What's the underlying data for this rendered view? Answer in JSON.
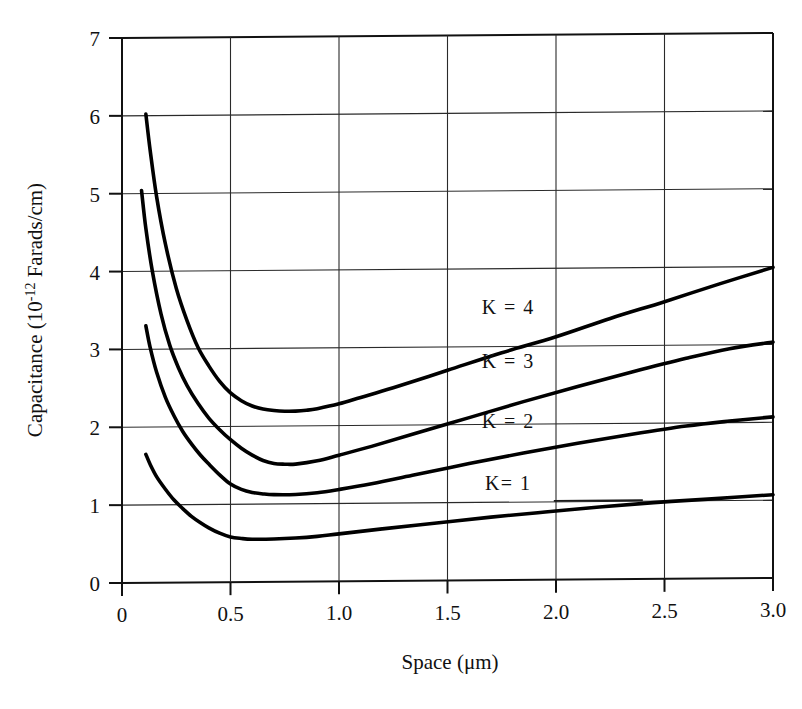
{
  "chart_data": {
    "type": "line",
    "title": "",
    "xlabel": "Space (μm)",
    "ylabel": "Capacitance (10-12 Farads/cm)",
    "ylabel_base": "Capacitance (10",
    "ylabel_exponent": "-12",
    "ylabel_tail": " Farads/cm)",
    "xlabel_text": "Space (μm)",
    "xlim": [
      0,
      3.0
    ],
    "ylim": [
      0,
      7
    ],
    "grid": true,
    "legend_position": "inline-annotations",
    "xticks": [
      "0",
      "0.5",
      "1.0",
      "1.5",
      "2.0",
      "2.5",
      "3.0"
    ],
    "xtick_values": [
      0,
      0.5,
      1.0,
      1.5,
      2.0,
      2.5,
      3.0
    ],
    "yticks": [
      "0",
      "1",
      "2",
      "3",
      "4",
      "5",
      "6",
      "7"
    ],
    "ytick_values": [
      0,
      1,
      2,
      3,
      4,
      5,
      6,
      7
    ],
    "series": [
      {
        "name": "K = 4",
        "label": "K = 4",
        "x": [
          0.11,
          0.13,
          0.16,
          0.2,
          0.25,
          0.3,
          0.35,
          0.4,
          0.45,
          0.5,
          0.55,
          0.6,
          0.65,
          0.7,
          0.75,
          0.8,
          0.85,
          0.9,
          1.0,
          1.1,
          1.25,
          1.5,
          1.75,
          2.0,
          2.25,
          2.5,
          2.75,
          3.0
        ],
        "values": [
          6.02,
          5.55,
          4.95,
          4.35,
          3.78,
          3.36,
          3.02,
          2.78,
          2.58,
          2.43,
          2.33,
          2.26,
          2.22,
          2.2,
          2.19,
          2.19,
          2.2,
          2.22,
          2.28,
          2.36,
          2.48,
          2.7,
          2.92,
          3.12,
          3.35,
          3.56,
          3.78,
          3.99
        ]
      },
      {
        "name": "K = 3",
        "label": "K = 3",
        "x": [
          0.09,
          0.11,
          0.14,
          0.18,
          0.22,
          0.26,
          0.3,
          0.35,
          0.4,
          0.45,
          0.5,
          0.55,
          0.6,
          0.65,
          0.7,
          0.75,
          0.8,
          0.9,
          1.0,
          1.15,
          1.35,
          1.6,
          1.85,
          2.1,
          2.35,
          2.6,
          2.8,
          3.0
        ],
        "values": [
          5.04,
          4.55,
          4.0,
          3.45,
          3.05,
          2.76,
          2.53,
          2.3,
          2.11,
          1.96,
          1.83,
          1.72,
          1.63,
          1.56,
          1.52,
          1.51,
          1.51,
          1.55,
          1.62,
          1.73,
          1.89,
          2.09,
          2.29,
          2.48,
          2.66,
          2.83,
          2.95,
          3.03
        ]
      },
      {
        "name": "K = 2",
        "label": "K = 2",
        "x": [
          0.11,
          0.13,
          0.16,
          0.2,
          0.24,
          0.28,
          0.32,
          0.36,
          0.4,
          0.45,
          0.5,
          0.55,
          0.6,
          0.65,
          0.7,
          0.8,
          0.9,
          1.0,
          1.15,
          1.35,
          1.6,
          1.85,
          2.1,
          2.35,
          2.6,
          2.8,
          3.0
        ],
        "values": [
          3.3,
          3.02,
          2.7,
          2.38,
          2.14,
          1.94,
          1.78,
          1.64,
          1.52,
          1.38,
          1.26,
          1.19,
          1.15,
          1.13,
          1.12,
          1.12,
          1.14,
          1.18,
          1.25,
          1.36,
          1.5,
          1.63,
          1.75,
          1.86,
          1.96,
          2.02,
          2.07
        ]
      },
      {
        "name": "K= 1",
        "label": "K= 1",
        "x": [
          0.11,
          0.13,
          0.16,
          0.2,
          0.24,
          0.28,
          0.32,
          0.36,
          0.4,
          0.45,
          0.5,
          0.55,
          0.6,
          0.7,
          0.8,
          0.9,
          1.0,
          1.2,
          1.45,
          1.7,
          1.95,
          2.2,
          2.45,
          2.7,
          3.0
        ],
        "values": [
          1.65,
          1.52,
          1.36,
          1.2,
          1.06,
          0.95,
          0.85,
          0.77,
          0.7,
          0.63,
          0.58,
          0.56,
          0.55,
          0.55,
          0.56,
          0.58,
          0.61,
          0.67,
          0.74,
          0.81,
          0.87,
          0.93,
          0.98,
          1.02,
          1.07
        ]
      }
    ],
    "annotations": [
      {
        "text": "K = 4",
        "x": 1.78,
        "y": 3.42
      },
      {
        "text": "K = 3",
        "x": 1.78,
        "y": 2.72
      },
      {
        "text": "K = 2",
        "x": 1.78,
        "y": 1.95
      },
      {
        "text": "K= 1",
        "x": 1.78,
        "y": 1.16
      }
    ],
    "colors": {
      "curve": "#000000",
      "grid": "#2a2a2a",
      "axis": "#111111",
      "background": "#ffffff"
    }
  }
}
